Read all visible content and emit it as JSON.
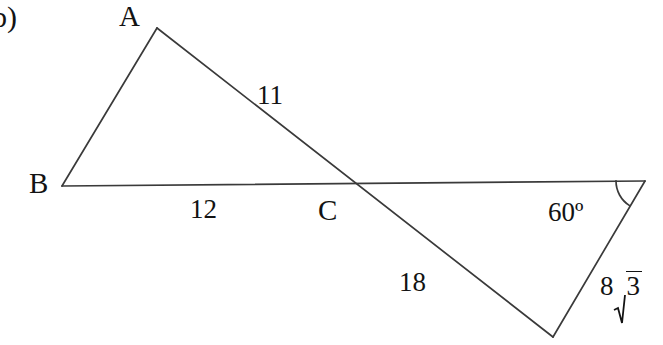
{
  "figure": {
    "item_marker": "b)",
    "background_color": "#ffffff",
    "stroke_color": "#3a3a3a",
    "text_color": "#131313",
    "vertices": {
      "A": {
        "label": "A",
        "x": 157,
        "y": 28
      },
      "B": {
        "label": "B",
        "x": 62,
        "y": 186
      },
      "C": {
        "label": "C",
        "x": 345,
        "y": 184
      },
      "D": {
        "label": "",
        "x": 645,
        "y": 181
      },
      "E": {
        "label": "",
        "x": 553,
        "y": 337
      }
    },
    "segments": [
      {
        "name": "segment-b-a",
        "from": "B",
        "to": "A"
      },
      {
        "name": "segment-a-e",
        "from": "A",
        "to": "E"
      },
      {
        "name": "segment-b-d",
        "from": "B",
        "to": "D"
      },
      {
        "name": "segment-d-e",
        "from": "D",
        "to": "E"
      }
    ],
    "labels": {
      "side_ac": "11",
      "side_bc": "12",
      "side_cd": "18",
      "side_de": "8√3",
      "side_de_coefficient": "8",
      "side_de_radicand": "3",
      "angle_at_d": "60º",
      "angle_value": 60,
      "angle_unit": "degrees"
    },
    "angle_arc": {
      "name": "angle-arc-60",
      "vertex": "D",
      "radius": 29
    }
  }
}
